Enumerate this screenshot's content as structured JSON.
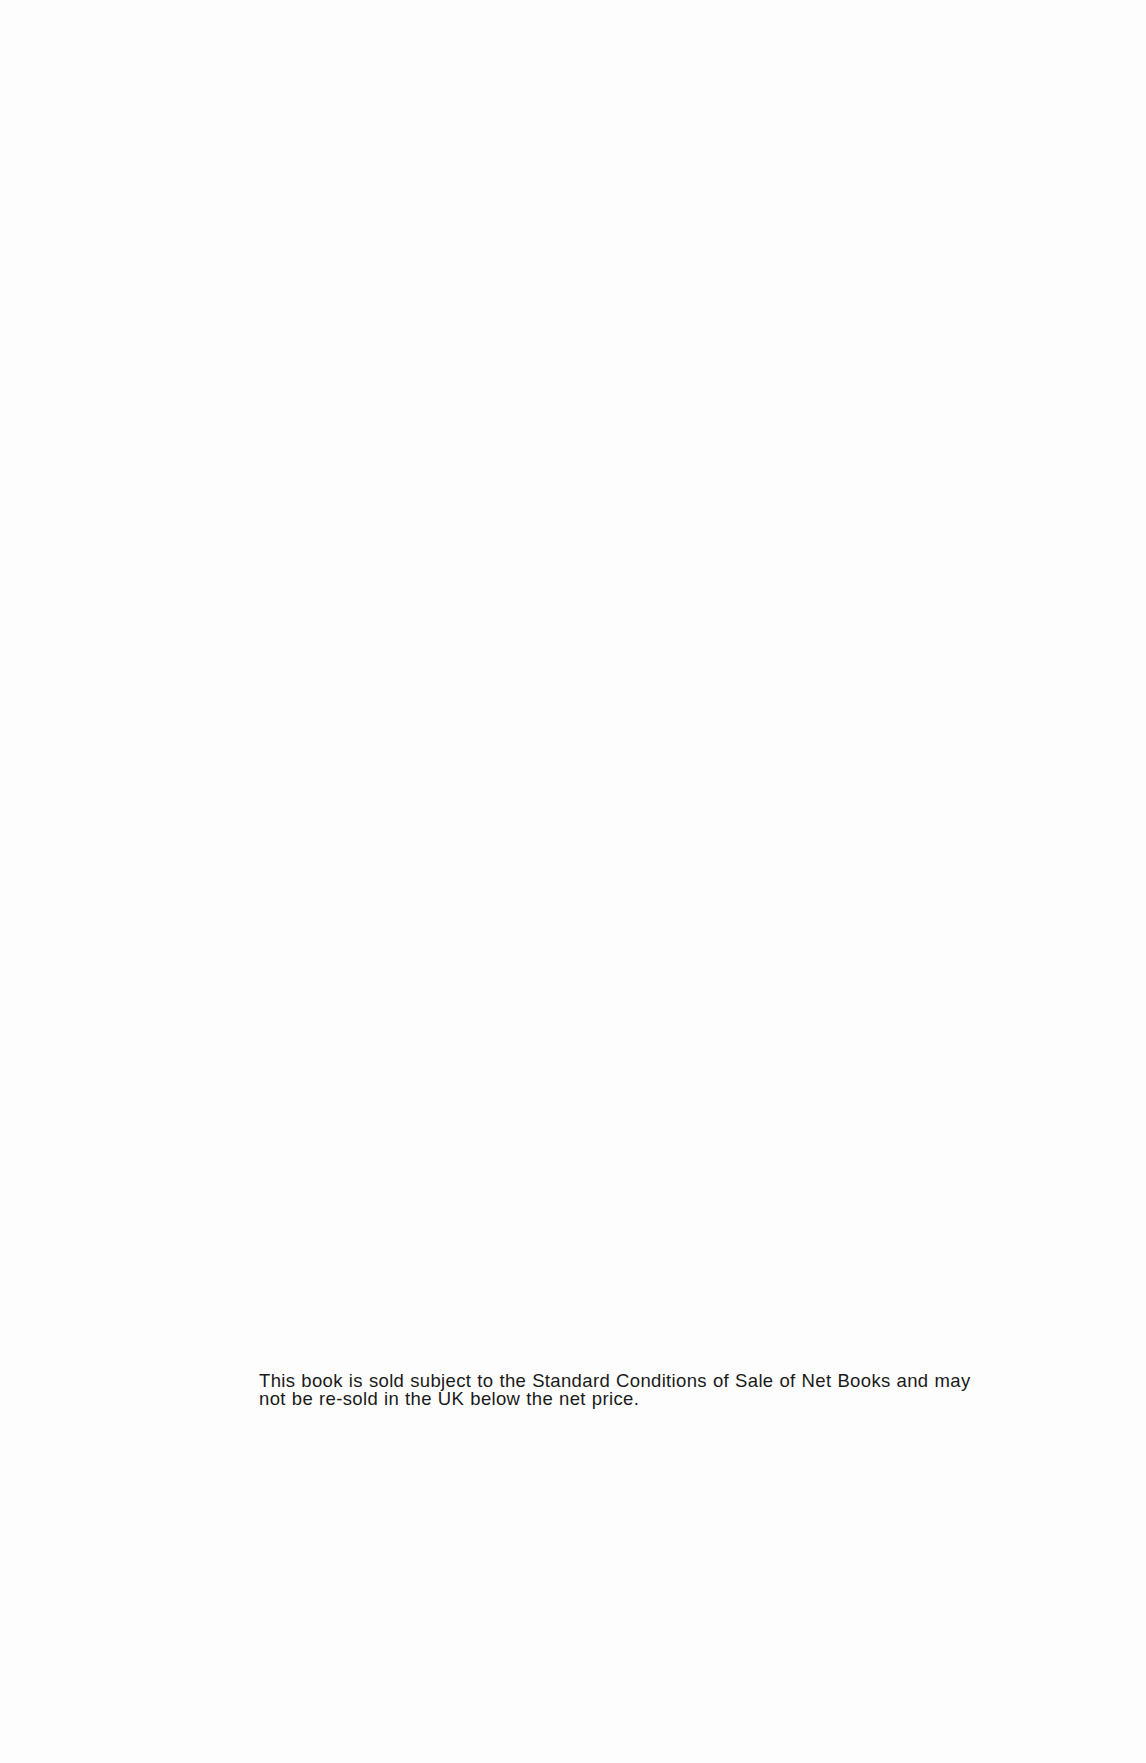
{
  "page": {
    "notice": {
      "lines": [
        "This book is sold subject to the Standard Conditions of Sale of Net Books and may",
        "not be re-sold in the UK below the net price."
      ]
    }
  }
}
